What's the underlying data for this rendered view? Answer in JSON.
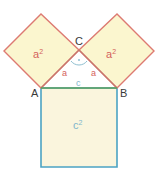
{
  "figure": {
    "background_color": "#ffffff"
  },
  "colors": {
    "leg_square_stroke": "#dd7a72",
    "leg_square_fill": "#fbf6cf",
    "hyp_square_stroke": "#4ba3c3",
    "hyp_square_fill": "#faf5dd",
    "hypotenuse_line": "#5da05d",
    "leg_line": "#c8766c",
    "angle_arc": "#8fbfd0",
    "label_red": "#d4625c",
    "label_blue": "#7fb6cc",
    "vertex_text": "#3a3a3a"
  },
  "vertices": [
    {
      "name": "A",
      "label": "A",
      "x": 41,
      "y": 88,
      "text_x": 31,
      "text_y": 97
    },
    {
      "name": "B",
      "label": "B",
      "x": 117,
      "y": 88,
      "text_x": 120,
      "text_y": 97
    },
    {
      "name": "C",
      "label": "C",
      "x": 79,
      "y": 50,
      "text_x": 75,
      "text_y": 45
    }
  ],
  "shapes": {
    "left_leg_square": {
      "label": "a",
      "exponent": "2",
      "points": "41,88 4,51 41,14 79,50",
      "label_x": 33,
      "label_y": 58
    },
    "right_leg_square": {
      "label": "a",
      "exponent": "2",
      "points": "79,50 117,14 154,51 117,88",
      "label_x": 106,
      "label_y": 58
    },
    "hypotenuse_square": {
      "label": "c",
      "exponent": "2",
      "points": "41,88 117,88 117,167 41,167",
      "label_x": 73,
      "label_y": 129
    }
  },
  "side_labels": [
    {
      "name": "leg-a-left",
      "text": "a",
      "x": 62,
      "y": 76
    },
    {
      "name": "leg-a-right",
      "text": "a",
      "x": 91,
      "y": 76
    },
    {
      "name": "hypotenuse-c",
      "text": "c",
      "x": 76,
      "y": 86
    }
  ],
  "angle_marker": {
    "name": "right-angle-arc-at-C",
    "path": "M 71 61 A 10 10 0 0 0 87 61",
    "dot_x": 79,
    "dot_y": 62
  }
}
